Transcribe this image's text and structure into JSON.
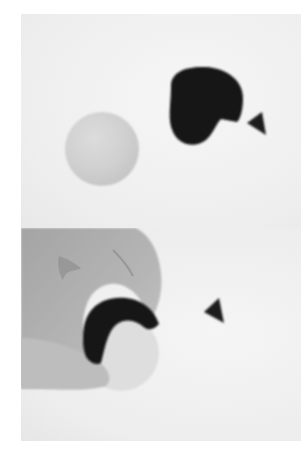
{
  "image": {
    "description": "Two stacked photographs showing a clay modeling step",
    "panels": [
      {
        "id": "top",
        "subjects": [
          "light clay ball",
          "dark clay shape (rounded, notched)",
          "small dark clay cone"
        ]
      },
      {
        "id": "bottom",
        "subjects": [
          "hand wrapping dark clay piece around light ball",
          "small dark clay cone"
        ]
      }
    ],
    "colors": {
      "background": "#f1f1f1",
      "ball": "#d2d2d2",
      "dark_clay": "#151515",
      "skin": "#a9a9a9"
    }
  }
}
